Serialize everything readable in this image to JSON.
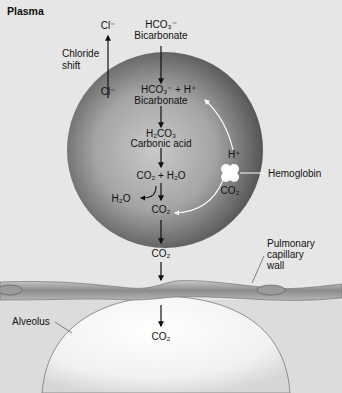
{
  "title": "Plasma",
  "labels": {
    "cl_top": "Cl⁻",
    "cl_bottom": "Cl⁻",
    "chloride_shift_1": "Chloride",
    "chloride_shift_2": "shift",
    "hco3_top_formula": "HCO₃⁻",
    "hco3_top_name": "Bicarbonate",
    "hco3_inner_formula": "HCO₃⁻ + H⁺",
    "hco3_inner_name": "Bicarbonate",
    "h_plus": "H⁺",
    "h2co3_formula": "H₂CO₃",
    "h2co3_name": "Carbonic acid",
    "hemoglobin": "Hemoglobin",
    "co2_hb": "CO₂",
    "co2_h2o": "CO₂ + H₂O",
    "h2o": "H₂O",
    "co2_inner": "CO₂",
    "co2_plasma": "CO₂",
    "pulmonary_1": "Pulmonary",
    "pulmonary_2": "capillary",
    "pulmonary_3": "wall",
    "alveolus": "Alveolus",
    "co2_alveolus": "CO₂"
  },
  "colors": {
    "plasma_bg": "#e7e7e7",
    "rbc_dark": "#5e5e5e",
    "rbc_light": "#bdbdbd",
    "wall": "#8a8a8a",
    "alveolus": "#f4f4f4",
    "arrow": "#111111"
  }
}
